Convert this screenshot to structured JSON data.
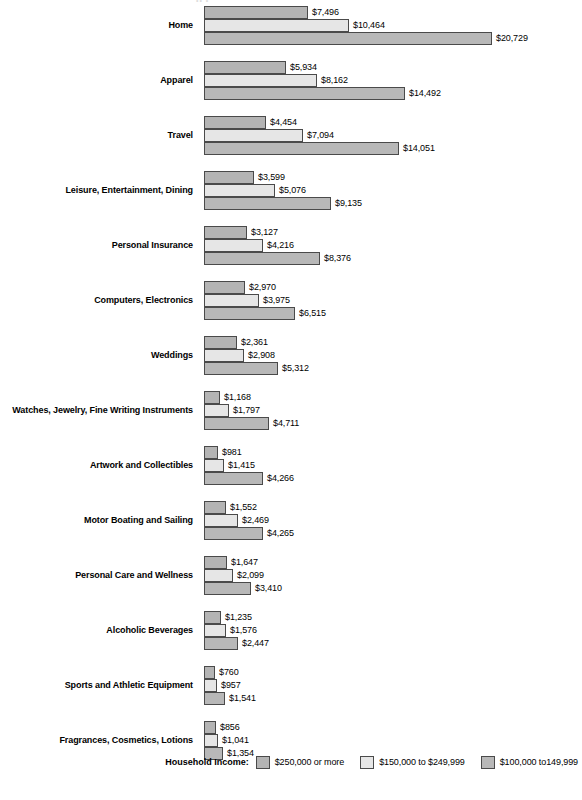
{
  "top_artifact": "•• •",
  "legend": {
    "title": "Household Income:",
    "entries": [
      {
        "label": "$250,000 or more",
        "color": "#b4b4b4",
        "swatch": "swatch-series-1"
      },
      {
        "label": "$150,000 to $249,999",
        "color": "#e6e6e6",
        "swatch": "swatch-series-2"
      },
      {
        "label": "$100,000 to149,999",
        "color": "#b8b8b8",
        "swatch": "swatch-series-3"
      }
    ]
  },
  "chart_data": {
    "type": "bar",
    "orientation": "horizontal",
    "grouped": true,
    "title": "",
    "subtitle": "",
    "xlabel": "",
    "ylabel": "",
    "grid": false,
    "legend_position": "bottom-right",
    "value_prefix": "$",
    "axis_max": 20729,
    "categories": [
      "Home",
      "Apparel",
      "Travel",
      "Leisure, Entertainment, Dining",
      "Personal Insurance",
      "Computers, Electronics",
      "Weddings",
      "Watches, Jewelry, Fine Writing Instruments",
      "Artwork and Collectibles",
      "Motor Boating and Sailing",
      "Personal Care and Wellness",
      "Alcoholic Beverages",
      "Sports and Athletic Equipment",
      "Fragrances, Cosmetics, Lotions"
    ],
    "series": [
      {
        "name": "$250,000 or more",
        "color": "#b4b4b4",
        "values": [
          7496,
          5934,
          4454,
          3599,
          3127,
          2970,
          2361,
          1168,
          981,
          1552,
          1647,
          1235,
          760,
          856
        ],
        "labels": [
          "$7,496",
          "$5,934",
          "$4,454",
          "$3,599",
          "$3,127",
          "$2,970",
          "$2,361",
          "$1,168",
          "$981",
          "$1,552",
          "$1,647",
          "$1,235",
          "$760",
          "$856"
        ]
      },
      {
        "name": "$150,000 to $249,999",
        "color": "#e6e6e6",
        "values": [
          10464,
          8162,
          7094,
          5076,
          4216,
          3975,
          2908,
          1797,
          1415,
          2469,
          2099,
          1576,
          957,
          1041
        ],
        "labels": [
          "$10,464",
          "$8,162",
          "$7,094",
          "$5,076",
          "$4,216",
          "$3,975",
          "$2,908",
          "$1,797",
          "$1,415",
          "$2,469",
          "$2,099",
          "$1,576",
          "$957",
          "$1,041"
        ]
      },
      {
        "name": "$100,000 to149,999",
        "color": "#b8b8b8",
        "values": [
          20729,
          14492,
          14051,
          9135,
          8376,
          6515,
          5312,
          4711,
          4266,
          4265,
          3410,
          2447,
          1541,
          1354
        ],
        "labels": [
          "$20,729",
          "$14,492",
          "$14,051",
          "$9,135",
          "$8,376",
          "$6,515",
          "$5,312",
          "$4,711",
          "$4,266",
          "$4,265",
          "$3,410",
          "$2,447",
          "$1,541",
          "$1,354"
        ]
      }
    ]
  }
}
